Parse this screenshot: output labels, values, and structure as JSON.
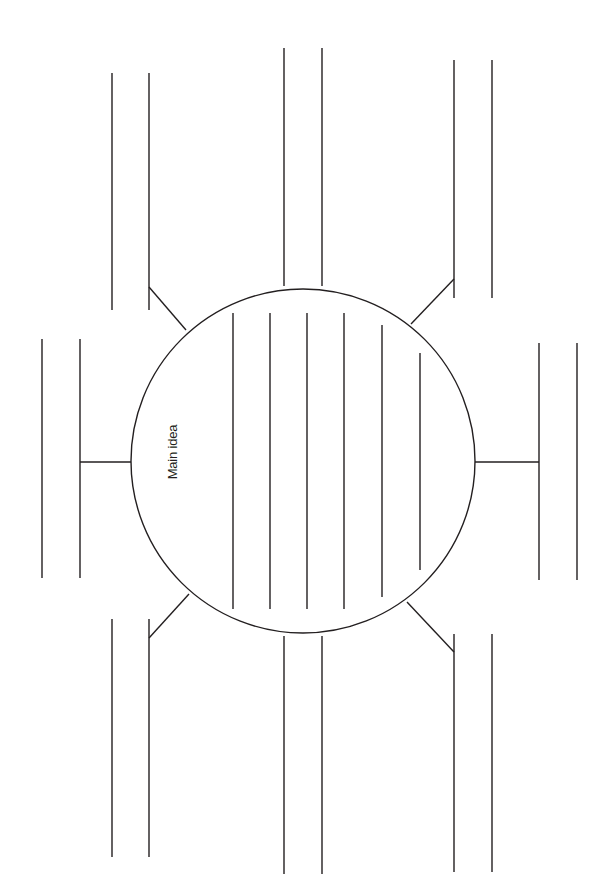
{
  "diagram": {
    "type": "concept-web",
    "main_label": "Main idea",
    "stroke_color": "#231f20",
    "background": "#ffffff",
    "center_circle": {
      "cx": 303,
      "cy": 461,
      "r": 172
    },
    "inner_writing_lines_count": 6,
    "branches": [
      {
        "position": "top",
        "lines": 2
      },
      {
        "position": "top-right",
        "lines": 2
      },
      {
        "position": "right",
        "lines": 2
      },
      {
        "position": "bottom-right",
        "lines": 2
      },
      {
        "position": "bottom",
        "lines": 2
      },
      {
        "position": "bottom-left",
        "lines": 2
      },
      {
        "position": "left",
        "lines": 2
      },
      {
        "position": "top-left",
        "lines": 2
      }
    ]
  }
}
